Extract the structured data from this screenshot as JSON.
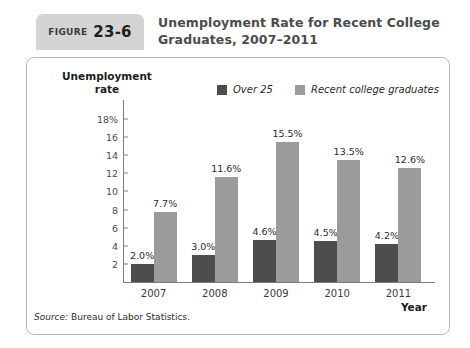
{
  "figure": {
    "badge_word": "FIGURE",
    "badge_number": "23-6",
    "title": "Unemployment Rate for Recent College Graduates, 2007–2011",
    "source_prefix": "Source:",
    "source_text": "Bureau of Labor Statistics."
  },
  "colors": {
    "series_over25": "#4d4d4d",
    "series_recent_grads": "#9b9b9b",
    "badge_background": "#d4d4d4",
    "panel_border": "#b9b9b9",
    "axis_line": "#7d7d7d",
    "title_text": "#4b4b4b"
  },
  "chart_data": {
    "type": "bar",
    "title": "Unemployment Rate for Recent College Graduates, 2007–2011",
    "xlabel": "Year",
    "ylabel": "Unemployment rate",
    "categories": [
      "2007",
      "2008",
      "2009",
      "2010",
      "2011"
    ],
    "series": [
      {
        "name": "Over 25",
        "color": "#4d4d4d",
        "values": [
          2.0,
          3.0,
          4.6,
          4.5,
          4.2
        ],
        "labels": [
          "2.0%",
          "3.0%",
          "4.6%",
          "4.5%",
          "4.2%"
        ]
      },
      {
        "name": "Recent college graduates",
        "color": "#9b9b9b",
        "values": [
          7.7,
          11.6,
          15.5,
          13.5,
          12.6
        ],
        "labels": [
          "7.7%",
          "11.6%",
          "15.5%",
          "13.5%",
          "12.6%"
        ]
      }
    ],
    "ylim": [
      0,
      19
    ],
    "yticks": [
      2,
      4,
      6,
      8,
      10,
      12,
      14,
      16,
      18
    ],
    "ytick_labels": [
      "2",
      "4",
      "6",
      "8",
      "10",
      "12",
      "14",
      "16",
      "18%"
    ],
    "grid": false,
    "legend_position": "top-center"
  }
}
